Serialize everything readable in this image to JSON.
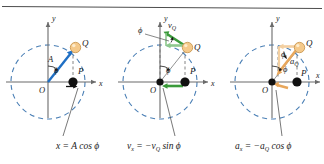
{
  "figure": {
    "name": "uniform-circular-motion-projection",
    "panel_count": 3,
    "top_rule": true,
    "colors": {
      "circle": "#4a7fb5",
      "axis": "#6b6b6b",
      "displacement": "#1f6fc4",
      "velocity": "#3a9a3a",
      "velocity_light": "#8dc88d",
      "acceleration": "#e8a75c",
      "acceleration_light": "#f3cfa0",
      "ball": "#f5c98a",
      "ball_edge": "#c99a55",
      "point": "#111111",
      "leader": "#555555",
      "text": "#1a1a1a"
    }
  },
  "panels": [
    {
      "id": "panel-displacement",
      "axis_x_label": "x",
      "axis_y_label": "y",
      "origin_label": "O",
      "ball_label": "Q",
      "point_label": "P",
      "angle_label": "ϕ",
      "vector_label": "A",
      "caption": "x = A cos ϕ"
    },
    {
      "id": "panel-velocity",
      "axis_x_label": "x",
      "axis_y_label": "y",
      "origin_label": "O",
      "ball_label": "Q",
      "point_label": "P",
      "angle_label": "ϕ",
      "angle_label_2": "ϕ",
      "vector_label": "v",
      "vector_sub": "Q",
      "caption_lhs": "v",
      "caption_lhs_sub": "x",
      "caption_rhs": " = −v",
      "caption_rhs_sub": "Q",
      "caption_tail": " sin ϕ"
    },
    {
      "id": "panel-acceleration",
      "axis_x_label": "x",
      "axis_y_label": "y",
      "origin_label": "O",
      "ball_label": "Q",
      "point_label": "P",
      "angle_label": "ϕ",
      "angle_label_2": "ϕ",
      "vector_label": "a",
      "vector_sub": "Q",
      "caption_lhs": "a",
      "caption_lhs_sub": "x",
      "caption_rhs": " = −a",
      "caption_rhs_sub": "Q",
      "caption_tail": " cos ϕ"
    }
  ]
}
